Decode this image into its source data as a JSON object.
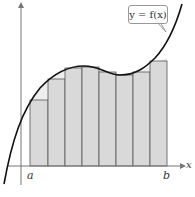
{
  "chart_data": {
    "type": "area",
    "title": "",
    "function_label": "y = f(x)",
    "xlabel": "x",
    "ylabel": "",
    "x_tick_labels": [
      "a",
      "b"
    ],
    "rectangles": {
      "count": 8,
      "kind": "inscribed (lower sum)",
      "x_edges_px": [
        30,
        48,
        65,
        82,
        99,
        116,
        133,
        150,
        167
      ],
      "top_y_px": [
        100,
        79,
        68,
        67,
        72,
        75,
        72,
        61
      ],
      "fill": "#d9d9d9",
      "stroke": "#555555"
    },
    "curve": {
      "shape": "cubic",
      "color": "#111111",
      "points_px": [
        [
          4,
          183
        ],
        [
          10,
          150
        ],
        [
          20,
          120
        ],
        [
          30,
          100
        ],
        [
          48,
          79
        ],
        [
          65,
          68
        ],
        [
          82,
          66
        ],
        [
          99,
          70
        ],
        [
          116,
          75
        ],
        [
          133,
          73
        ],
        [
          150,
          62
        ],
        [
          160,
          48
        ],
        [
          170,
          30
        ],
        [
          180,
          5
        ]
      ]
    },
    "axes": {
      "x_axis_y_px": 166,
      "y_axis_x_px": 21,
      "grid": false
    }
  },
  "labels": {
    "a": "a",
    "b": "b",
    "x": "x",
    "callout": "y = f(x)"
  }
}
